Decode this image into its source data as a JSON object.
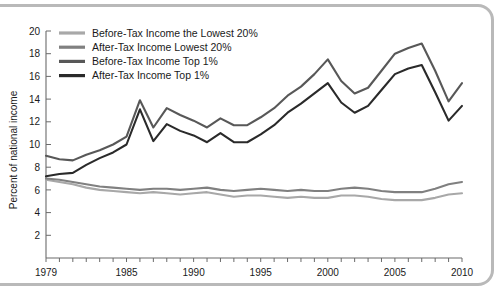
{
  "chart_data": {
    "type": "line",
    "title": "",
    "xlabel": "",
    "ylabel": "Percent of national income",
    "xlim": [
      1979,
      2010
    ],
    "ylim": [
      0,
      20
    ],
    "yticks": [
      2,
      4,
      6,
      8,
      10,
      12,
      14,
      16,
      18,
      20
    ],
    "xticks": [
      1979,
      1985,
      1990,
      1995,
      2000,
      2005,
      2010
    ],
    "grid": false,
    "legend_position": "top-left",
    "x": [
      1979,
      1980,
      1981,
      1982,
      1983,
      1984,
      1985,
      1986,
      1987,
      1988,
      1989,
      1990,
      1991,
      1992,
      1993,
      1994,
      1995,
      1996,
      1997,
      1998,
      1999,
      2000,
      2001,
      2002,
      2003,
      2004,
      2005,
      2006,
      2007,
      2008,
      2009,
      2010
    ],
    "series": [
      {
        "name": "Before-Tax Income the Lowest 20%",
        "color": "#a8a8a8",
        "values": [
          6.9,
          6.7,
          6.5,
          6.2,
          6.0,
          5.9,
          5.8,
          5.7,
          5.8,
          5.7,
          5.6,
          5.7,
          5.8,
          5.6,
          5.4,
          5.5,
          5.5,
          5.4,
          5.3,
          5.4,
          5.3,
          5.3,
          5.5,
          5.5,
          5.4,
          5.2,
          5.1,
          5.1,
          5.1,
          5.3,
          5.6,
          5.7
        ]
      },
      {
        "name": "After-Tax Income Lowest 20%",
        "color": "#808080",
        "values": [
          7.0,
          6.9,
          6.7,
          6.5,
          6.3,
          6.2,
          6.1,
          6.0,
          6.1,
          6.1,
          6.0,
          6.1,
          6.2,
          6.0,
          5.9,
          6.0,
          6.1,
          6.0,
          5.9,
          6.0,
          5.9,
          5.9,
          6.1,
          6.2,
          6.1,
          5.9,
          5.8,
          5.8,
          5.8,
          6.1,
          6.5,
          6.7
        ]
      },
      {
        "name": "Before-Tax Income Top 1%",
        "color": "#585858",
        "values": [
          9.0,
          8.7,
          8.6,
          9.1,
          9.5,
          10.0,
          10.7,
          13.9,
          11.5,
          13.2,
          12.6,
          12.1,
          11.5,
          12.3,
          11.7,
          11.7,
          12.4,
          13.2,
          14.3,
          15.1,
          16.2,
          17.5,
          15.6,
          14.5,
          15.0,
          16.5,
          18.0,
          18.5,
          18.9,
          16.5,
          13.8,
          15.4
        ]
      },
      {
        "name": "After-Tax Income Top 1%",
        "color": "#2a2a2a",
        "values": [
          7.2,
          7.4,
          7.5,
          8.2,
          8.8,
          9.3,
          10.0,
          13.1,
          10.3,
          11.8,
          11.2,
          10.8,
          10.2,
          11.0,
          10.2,
          10.2,
          10.9,
          11.7,
          12.8,
          13.6,
          14.5,
          15.4,
          13.7,
          12.8,
          13.4,
          14.8,
          16.2,
          16.7,
          17.0,
          14.6,
          12.1,
          13.4
        ]
      }
    ]
  },
  "axes": {
    "y_label": "Percent of national income",
    "y_ticks": [
      "20",
      "18",
      "16",
      "14",
      "12",
      "10",
      "8",
      "6",
      "4",
      "2"
    ],
    "x_ticks": [
      "1979",
      "1985",
      "1990",
      "1995",
      "2000",
      "2005",
      "2010"
    ]
  },
  "legend": {
    "items": [
      {
        "label": "Before-Tax Income the Lowest 20%",
        "color": "#a8a8a8"
      },
      {
        "label": "After-Tax Income Lowest 20%",
        "color": "#808080"
      },
      {
        "label": "Before-Tax Income Top 1%",
        "color": "#585858"
      },
      {
        "label": "After-Tax Income Top 1%",
        "color": "#2a2a2a"
      }
    ]
  }
}
